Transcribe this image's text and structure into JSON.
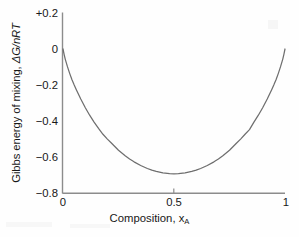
{
  "chart_data": {
    "type": "line",
    "title": "",
    "xlabel": "Composition, x",
    "xlabel_sub": "A",
    "ylabel_plain": "Gibbs energy of mixing, ",
    "ylabel_italic": "ΔG/nRT",
    "xlim": [
      0,
      1
    ],
    "ylim": [
      -0.8,
      0.2
    ],
    "xticks": [
      0,
      0.5,
      1
    ],
    "xticklabels": [
      "0",
      "0.5",
      "1"
    ],
    "yticks": [
      0.2,
      0,
      -0.2,
      -0.4,
      -0.6,
      -0.8
    ],
    "yticklabels": [
      "+0.2",
      "0",
      "−0.2",
      "−0.4",
      "−0.6",
      "−0.8"
    ],
    "grid": false,
    "legend": false,
    "line_color": "#6e6e6e",
    "axis_color": "#8c8c8c",
    "background": "#fefefe",
    "equation": "ΔG/nRT = x ln x + (1−x) ln(1−x)",
    "minimum": {
      "x": 0.5,
      "y": -0.6931
    },
    "series": [
      {
        "name": "ideal mixing",
        "x": [
          0.0,
          0.005,
          0.01,
          0.02,
          0.03,
          0.04,
          0.05,
          0.06,
          0.08,
          0.1,
          0.12,
          0.14,
          0.16,
          0.18,
          0.2,
          0.22,
          0.25,
          0.28,
          0.3,
          0.32,
          0.35,
          0.38,
          0.4,
          0.42,
          0.45,
          0.48,
          0.5,
          0.52,
          0.55,
          0.58,
          0.6,
          0.62,
          0.65,
          0.68,
          0.7,
          0.72,
          0.75,
          0.78,
          0.8,
          0.82,
          0.84,
          0.86,
          0.88,
          0.9,
          0.92,
          0.94,
          0.95,
          0.96,
          0.97,
          0.98,
          0.99,
          0.995,
          1.0
        ],
        "y": [
          0.0,
          -0.0294,
          -0.056,
          -0.098,
          -0.1352,
          -0.1691,
          -0.1985,
          -0.2259,
          -0.2778,
          -0.3251,
          -0.3677,
          -0.406,
          -0.4412,
          -0.4738,
          -0.5004,
          -0.5247,
          -0.5623,
          -0.5929,
          -0.6109,
          -0.6269,
          -0.6474,
          -0.664,
          -0.673,
          -0.6802,
          -0.6881,
          -0.6924,
          -0.6931,
          -0.6924,
          -0.6881,
          -0.6802,
          -0.673,
          -0.664,
          -0.6474,
          -0.6269,
          -0.6109,
          -0.5929,
          -0.5623,
          -0.5247,
          -0.5004,
          -0.4738,
          -0.4478,
          -0.406,
          -0.3677,
          -0.3251,
          -0.2778,
          -0.2259,
          -0.1985,
          -0.1691,
          -0.1352,
          -0.098,
          -0.056,
          -0.0294,
          0.0
        ]
      }
    ]
  },
  "figure": {
    "caption": ""
  }
}
